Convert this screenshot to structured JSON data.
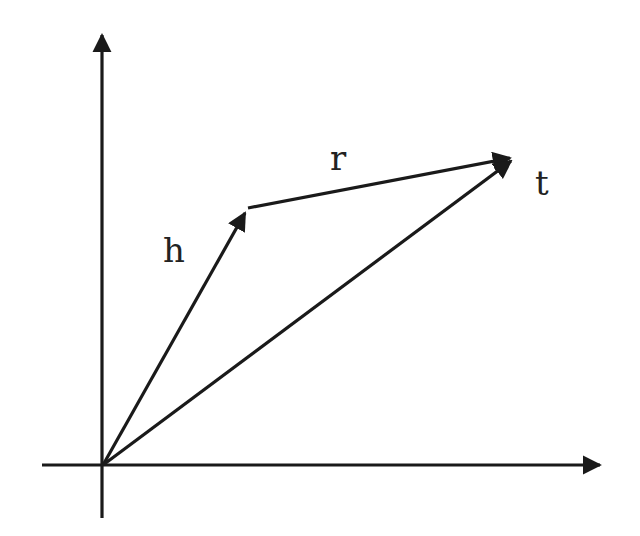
{
  "diagram": {
    "colors": {
      "stroke": "#1a1a1a",
      "background": "#ffffff",
      "label": "#222222"
    },
    "origin": [
      103,
      465
    ],
    "axes": {
      "x_axis": {
        "from": [
          42,
          465
        ],
        "to": [
          606,
          465
        ]
      },
      "y_axis": {
        "from": [
          102,
          518
        ],
        "to": [
          102,
          29
        ]
      }
    },
    "vectors": [
      {
        "name": "h",
        "from": [
          103,
          465
        ],
        "to": [
          248,
          208
        ]
      },
      {
        "name": "r",
        "from": [
          248,
          208
        ],
        "to": [
          516,
          157
        ]
      },
      {
        "name": "t",
        "from": [
          103,
          465
        ],
        "to": [
          516,
          157
        ]
      }
    ],
    "labels": {
      "h": {
        "text": "h",
        "x": 163,
        "y": 262
      },
      "r": {
        "text": "r",
        "x": 330,
        "y": 170
      },
      "t": {
        "text": "t",
        "x": 535,
        "y": 195
      }
    }
  }
}
